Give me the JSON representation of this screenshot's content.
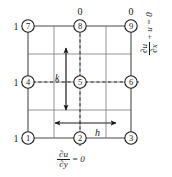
{
  "figure": {
    "grid": {
      "x_lines": [
        28,
        54,
        80,
        106,
        131
      ],
      "y_lines": [
        26,
        54,
        82,
        110,
        138
      ],
      "line_color": "#6b6b6b",
      "border_color": "#3a3a3a"
    },
    "nodes": [
      {
        "id": "1",
        "x": 28,
        "y": 138
      },
      {
        "id": "2",
        "x": 80,
        "y": 138
      },
      {
        "id": "3",
        "x": 131,
        "y": 138
      },
      {
        "id": "4",
        "x": 28,
        "y": 82
      },
      {
        "id": "5",
        "x": 80,
        "y": 82
      },
      {
        "id": "6",
        "x": 131,
        "y": 82
      },
      {
        "id": "7",
        "x": 28,
        "y": 26
      },
      {
        "id": "8",
        "x": 80,
        "y": 26
      },
      {
        "id": "9",
        "x": 131,
        "y": 26
      }
    ],
    "boundary_values": [
      {
        "label": "1",
        "x": 16,
        "y": 29,
        "side": "left",
        "node": "7"
      },
      {
        "label": "1",
        "x": 16,
        "y": 85,
        "side": "left",
        "node": "4"
      },
      {
        "label": "1",
        "x": 16,
        "y": 141,
        "side": "left",
        "node": "1"
      },
      {
        "label": "0",
        "x": 80,
        "y": 14,
        "side": "top",
        "node": "8"
      },
      {
        "label": "0",
        "x": 131,
        "y": 14,
        "side": "top",
        "node": "9"
      }
    ],
    "dimensions": [
      {
        "name": "k",
        "label": "k",
        "orientation": "vertical",
        "x": 66,
        "y1": 48,
        "y2": 110,
        "label_x": 57,
        "label_y": 78
      },
      {
        "name": "h",
        "label": "h",
        "orientation": "horizontal",
        "y": 123,
        "x1": 55,
        "x2": 116,
        "label_x": 98,
        "label_y": 134
      }
    ],
    "symmetry_lines": [
      {
        "orientation": "vertical",
        "x": 80,
        "y1": 26,
        "y2": 145
      },
      {
        "orientation": "horizontal",
        "y": 82,
        "x1": 22,
        "x2": 138
      }
    ],
    "equations": {
      "bottom": {
        "numerator": "∂u",
        "denominator": "∂y",
        "tail": "= 0"
      },
      "right": {
        "numerator": "∂u",
        "denominator": "∂x",
        "tail": "+ u = 0"
      }
    }
  }
}
